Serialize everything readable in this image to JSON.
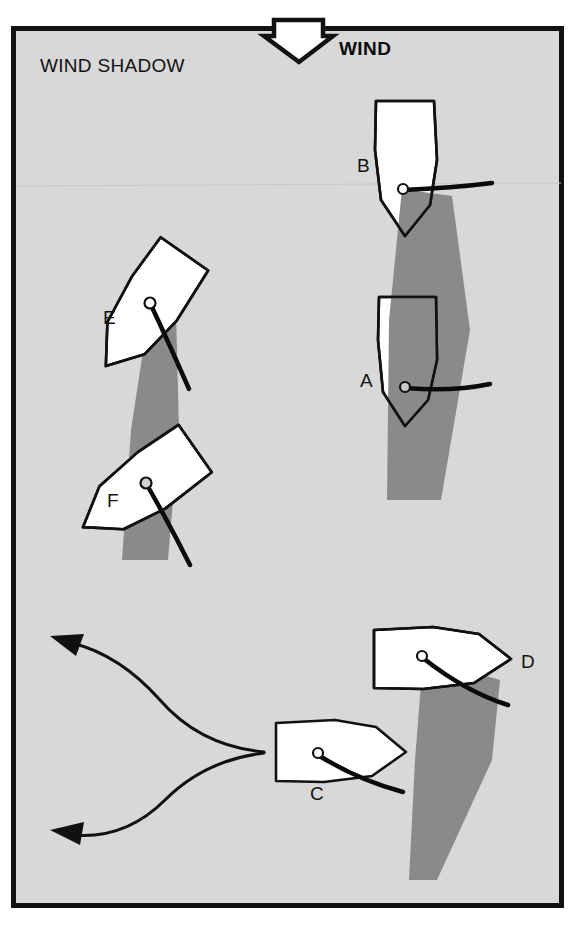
{
  "figure": {
    "panel_label": "WIND SHADOW",
    "wind_label": "WIND",
    "wind_arrow_icon": "wind-arrow-down-icon",
    "colors": {
      "page_background": "#ffffff",
      "panel_background": "#d8d8d8",
      "panel_border": "#111111",
      "hull_fill": "#ffffff",
      "hull_stroke": "#111111",
      "shadow_fill": "#8a8a8a",
      "sail_stroke": "#0a0a0a",
      "mast_fill": "#ffffff",
      "path_stroke": "#111111",
      "label_text": "#111111"
    },
    "panel": {
      "x": 11,
      "y": 26,
      "width": 553,
      "height": 882,
      "border_width": 5
    }
  },
  "boats": [
    {
      "id": "B",
      "label": "B",
      "label_x": 357,
      "label_y": 172,
      "heading_deg": 180,
      "description": "Boat B sailing downwind, casting wind shadow over boat A",
      "has_wind_shadow": true,
      "in_wind_shadow": false
    },
    {
      "id": "A",
      "label": "A",
      "label_x": 360,
      "label_y": 387,
      "heading_deg": 180,
      "description": "Boat A blanketed inside boat B wind shadow",
      "has_wind_shadow": false,
      "in_wind_shadow": true
    },
    {
      "id": "E",
      "label": "E",
      "label_x": 103,
      "label_y": 324,
      "heading_deg": 215,
      "description": "Boat E on a reach, casting wind shadow over boat F",
      "has_wind_shadow": true,
      "in_wind_shadow": false
    },
    {
      "id": "F",
      "label": "F",
      "label_x": 107,
      "label_y": 507,
      "heading_deg": 235,
      "description": "Boat F blanketed inside boat E wind shadow",
      "has_wind_shadow": false,
      "in_wind_shadow": true
    },
    {
      "id": "D",
      "label": "D",
      "label_x": 521,
      "label_y": 668,
      "heading_deg": 270,
      "description": "Boat D sailing across, casting a long wind shadow to leeward",
      "has_wind_shadow": true,
      "in_wind_shadow": false
    },
    {
      "id": "C",
      "label": "C",
      "label_x": 310,
      "label_y": 800,
      "heading_deg": 270,
      "description": "Boat C approaching with two alternative course options",
      "has_wind_shadow": false,
      "in_wind_shadow": false
    }
  ],
  "course_options": [
    {
      "name": "upper-course-arrow",
      "direction": "up-left",
      "arrowhead": "triangle"
    },
    {
      "name": "lower-course-arrow",
      "direction": "down-left",
      "arrowhead": "triangle"
    }
  ]
}
